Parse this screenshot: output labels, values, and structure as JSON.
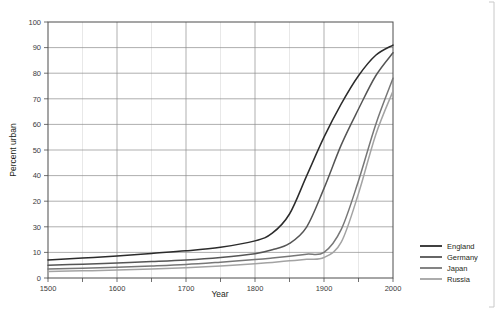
{
  "chart_data": {
    "type": "line",
    "title": "",
    "xlabel": "Year",
    "ylabel": "Percent urban",
    "xlim": [
      1500,
      2000
    ],
    "ylim": [
      0,
      100
    ],
    "grid": true,
    "legend_position": "right",
    "x_ticks": [
      1500,
      1600,
      1700,
      1800,
      1900,
      2000
    ],
    "x_tick_labels": [
      "1500",
      "1600",
      "1700",
      "1800",
      "1900",
      "2000"
    ],
    "x_minor_ticks": [
      1550,
      1650,
      1750,
      1850,
      1950
    ],
    "y_ticks": [
      0,
      10,
      20,
      30,
      40,
      50,
      60,
      70,
      80,
      90,
      100
    ],
    "y_tick_labels": [
      "0",
      "30",
      "20",
      "40",
      "50",
      "60",
      "70",
      "80",
      "90",
      "100"
    ],
    "y_tick_label_values": [
      0,
      10,
      20,
      30,
      40,
      50,
      60,
      70,
      80,
      90,
      100
    ],
    "y_tick_labels_as_printed": [
      "0",
      "10",
      "30",
      "20",
      "40",
      "50",
      "60",
      "70",
      "80",
      "90",
      "100"
    ],
    "x": [
      1500,
      1550,
      1600,
      1650,
      1700,
      1750,
      1800,
      1825,
      1850,
      1875,
      1900,
      1925,
      1950,
      1975,
      2000
    ],
    "series": [
      {
        "name": "England",
        "color": "#2b2b2b",
        "values": [
          7.0,
          7.8,
          8.6,
          9.6,
          10.6,
          12.0,
          14.5,
          17.5,
          25.0,
          40.0,
          55.0,
          68.0,
          79.0,
          87.0,
          91.0
        ]
      },
      {
        "name": "Germany",
        "color": "#555555",
        "values": [
          5.0,
          5.4,
          5.9,
          6.4,
          7.0,
          8.0,
          9.5,
          11.0,
          13.5,
          20.0,
          35.0,
          52.0,
          66.0,
          79.0,
          88.0
        ]
      },
      {
        "name": "Japan",
        "color": "#777777",
        "values": [
          3.5,
          3.8,
          4.2,
          4.7,
          5.3,
          6.2,
          7.2,
          7.8,
          8.5,
          9.3,
          10.0,
          19.0,
          38.0,
          60.0,
          78.0
        ]
      },
      {
        "name": "Russia",
        "color": "#a3a3a3",
        "values": [
          2.5,
          2.8,
          3.1,
          3.5,
          4.0,
          4.7,
          5.6,
          6.1,
          6.7,
          7.3,
          8.0,
          14.0,
          33.0,
          56.0,
          73.0
        ]
      }
    ]
  },
  "legend": {
    "items": [
      {
        "label": "England"
      },
      {
        "label": "Germany"
      },
      {
        "label": "Japan"
      },
      {
        "label": "Russia"
      }
    ]
  },
  "axes": {
    "x_title": "Year",
    "y_title": "Percent urban"
  }
}
